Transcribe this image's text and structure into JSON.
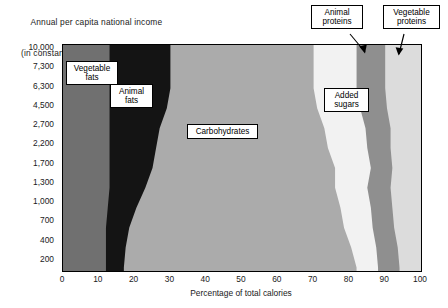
{
  "chart_title": {
    "line1": "Annual per capita national income",
    "line2": "(in constant 1993 US $s)"
  },
  "axes": {
    "x_title": "Percentage of total calories",
    "x_ticks": [
      "0",
      "10",
      "20",
      "30",
      "40",
      "50",
      "60",
      "70",
      "80",
      "90",
      "100"
    ],
    "y_ticks": [
      "10,000",
      "7,300",
      "6,300",
      "4,500",
      "2,700",
      "2,200",
      "1,700",
      "1,300",
      "1,000",
      "700",
      "400",
      "200"
    ]
  },
  "labels": {
    "vegetable_fats": "Vegetable\nfats",
    "animal_fats": "Animal\nfats",
    "carbohydrates": "Carbohydrates",
    "added_sugars": "Added\nsugars",
    "animal_proteins": "Animal\nproteins",
    "vegetable_proteins": "Vegetable\nproteins"
  },
  "colors": {
    "vegetable_fats": "#707070",
    "animal_fats": "#141414",
    "carbohydrates": "#ababab",
    "added_sugars": "#f2f2f2",
    "animal_proteins": "#8f8f8f",
    "vegetable_proteins": "#dcdcdc",
    "axis": "#000000",
    "background": "#ffffff"
  },
  "chart_data": {
    "type": "area",
    "title": "Annual per capita national income (in constant 1993 US $s)",
    "subtitle": "",
    "xlabel": "Percentage of total calories",
    "ylabel": "Annual per capita national income (in constant 1993 US $s)",
    "xlim": [
      0,
      100
    ],
    "grid": false,
    "legend": "inline-callout-boxes",
    "orientation": "horizontal-stacked-100pct",
    "y_categories": [
      "200",
      "400",
      "700",
      "1,000",
      "1,300",
      "1,700",
      "2,200",
      "2,700",
      "4,500",
      "6,300",
      "7,300",
      "10,000"
    ],
    "note": "Stacked 100% horizontal band chart; each income level row sums to 100% of calories. Values are cumulative band edges read off the x-axis.",
    "series": [
      {
        "name": "Vegetable fats",
        "color": "#707070",
        "values_by_income": {
          "200": 12,
          "400": 12,
          "700": 12,
          "1,000": 12.5,
          "1,300": 13,
          "1,700": 13,
          "2,200": 13,
          "2,700": 13,
          "4,500": 13,
          "6,300": 13,
          "7,300": 13,
          "10,000": 13
        }
      },
      {
        "name": "Animal fats",
        "color": "#141414",
        "values_by_income": {
          "200": 5,
          "400": 5.5,
          "700": 6.5,
          "1,000": 8,
          "1,300": 10,
          "1,700": 12,
          "2,200": 13,
          "2,700": 14,
          "4,500": 16,
          "6,300": 17,
          "7,300": 17,
          "10,000": 17
        }
      },
      {
        "name": "Carbohydrates",
        "color": "#ababab",
        "values_by_income": {
          "200": 65,
          "400": 63,
          "700": 60,
          "1,000": 57,
          "1,300": 53,
          "1,700": 51,
          "2,200": 48,
          "2,700": 46,
          "4,500": 42,
          "6,300": 40,
          "7,300": 40,
          "10,000": 40
        }
      },
      {
        "name": "Added sugars",
        "color": "#f2f2f2",
        "values_by_income": {
          "200": 6,
          "400": 7,
          "700": 8,
          "1,000": 8.5,
          "1,300": 9,
          "1,700": 10,
          "2,200": 11,
          "2,700": 11.5,
          "4,500": 12,
          "6,300": 12,
          "7,300": 12,
          "10,000": 12
        }
      },
      {
        "name": "Animal proteins",
        "color": "#8f8f8f",
        "values_by_income": {
          "200": 6,
          "400": 6,
          "700": 6,
          "1,000": 6,
          "1,300": 6.5,
          "1,700": 6,
          "2,200": 6.5,
          "2,700": 7,
          "4,500": 7.5,
          "6,300": 8,
          "7,300": 8,
          "10,000": 8
        }
      },
      {
        "name": "Vegetable proteins",
        "color": "#dcdcdc",
        "values_by_income": {
          "200": 6,
          "400": 6.5,
          "700": 7.5,
          "1,000": 8,
          "1,300": 8.5,
          "1,700": 8,
          "2,200": 8.5,
          "2,700": 8.5,
          "4,500": 9.5,
          "6,300": 10,
          "7,300": 10,
          "10,000": 10
        }
      }
    ],
    "cumulative_boundaries": {
      "description": "Right edge (% of total calories) of each band, bottom (200) to top (10,000)",
      "income_levels": [
        "200",
        "400",
        "700",
        "1,000",
        "1,300",
        "1,700",
        "2,200",
        "2,700",
        "4,500",
        "6,300",
        "7,300",
        "10,000"
      ],
      "vegetable_fats": [
        12,
        12,
        12,
        12.5,
        13,
        13,
        13,
        13,
        13,
        13,
        13,
        13
      ],
      "animal_fats": [
        17,
        17.5,
        18.5,
        20.5,
        23,
        25,
        26,
        27,
        29,
        30,
        30,
        30
      ],
      "carbohydrates": [
        82,
        80.5,
        78.5,
        77.5,
        76,
        76,
        74,
        73,
        71,
        70,
        70,
        70
      ],
      "added_sugars": [
        88,
        87.5,
        86.5,
        86,
        85,
        86,
        85,
        84.5,
        83,
        82,
        82,
        82
      ],
      "animal_proteins": [
        94,
        93.5,
        92.5,
        92,
        91.5,
        92,
        91.5,
        91.5,
        90.5,
        90,
        90,
        90
      ],
      "vegetable_proteins": [
        100,
        100,
        100,
        100,
        100,
        100,
        100,
        100,
        100,
        100,
        100,
        100
      ]
    }
  }
}
